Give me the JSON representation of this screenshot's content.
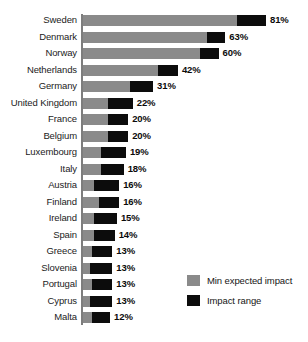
{
  "chart_data": {
    "type": "bar",
    "orientation": "horizontal",
    "stacked": true,
    "title": "",
    "subtitle": "",
    "xlabel": "",
    "ylabel": "",
    "grid": false,
    "xlim": [
      0,
      81
    ],
    "axis_ticks": [],
    "legend_position": "bottom-right",
    "legend": [
      {
        "name": "Min expected impact",
        "color": "#8a8a8a"
      },
      {
        "name": "Impact range",
        "color": "#0c0c0c"
      }
    ],
    "categories": [
      "Sweden",
      "Denmark",
      "Norway",
      "Netherlands",
      "Germany",
      "United Kingdom",
      "France",
      "Belgium",
      "Luxembourg",
      "Italy",
      "Austria",
      "Finland",
      "Ireland",
      "Spain",
      "Greece",
      "Slovenia",
      "Portugal",
      "Cyprus",
      "Malta"
    ],
    "series": [
      {
        "name": "Min expected impact",
        "color": "#8a8a8a",
        "values": [
          68,
          55,
          52,
          33,
          21,
          11,
          11,
          11,
          8,
          8,
          5,
          7,
          5,
          5,
          4,
          3,
          4,
          3,
          4
        ]
      },
      {
        "name": "Impact range",
        "color": "#0c0c0c",
        "values": [
          13,
          8,
          8,
          9,
          10,
          11,
          9,
          9,
          11,
          10,
          11,
          9,
          10,
          9,
          9,
          10,
          9,
          10,
          8
        ]
      }
    ],
    "value_labels": [
      "81%",
      "63%",
      "60%",
      "42%",
      "31%",
      "22%",
      "20%",
      "20%",
      "19%",
      "18%",
      "16%",
      "16%",
      "15%",
      "14%",
      "13%",
      "13%",
      "13%",
      "13%",
      "12%"
    ],
    "totals": [
      81,
      63,
      60,
      42,
      31,
      22,
      20,
      20,
      19,
      18,
      16,
      16,
      15,
      14,
      13,
      13,
      13,
      13,
      12
    ],
    "rows": [
      {
        "category": "Sweden",
        "min": 68,
        "range": 13,
        "total": 81,
        "label": "81%"
      },
      {
        "category": "Denmark",
        "min": 55,
        "range": 8,
        "total": 63,
        "label": "63%"
      },
      {
        "category": "Norway",
        "min": 52,
        "range": 8,
        "total": 60,
        "label": "60%"
      },
      {
        "category": "Netherlands",
        "min": 33,
        "range": 9,
        "total": 42,
        "label": "42%"
      },
      {
        "category": "Germany",
        "min": 21,
        "range": 10,
        "total": 31,
        "label": "31%"
      },
      {
        "category": "United Kingdom",
        "min": 11,
        "range": 11,
        "total": 22,
        "label": "22%"
      },
      {
        "category": "France",
        "min": 11,
        "range": 9,
        "total": 20,
        "label": "20%"
      },
      {
        "category": "Belgium",
        "min": 11,
        "range": 9,
        "total": 20,
        "label": "20%"
      },
      {
        "category": "Luxembourg",
        "min": 8,
        "range": 11,
        "total": 19,
        "label": "19%"
      },
      {
        "category": "Italy",
        "min": 8,
        "range": 10,
        "total": 18,
        "label": "18%"
      },
      {
        "category": "Austria",
        "min": 5,
        "range": 11,
        "total": 16,
        "label": "16%"
      },
      {
        "category": "Finland",
        "min": 7,
        "range": 9,
        "total": 16,
        "label": "16%"
      },
      {
        "category": "Ireland",
        "min": 5,
        "range": 10,
        "total": 15,
        "label": "15%"
      },
      {
        "category": "Spain",
        "min": 5,
        "range": 9,
        "total": 14,
        "label": "14%"
      },
      {
        "category": "Greece",
        "min": 4,
        "range": 9,
        "total": 13,
        "label": "13%"
      },
      {
        "category": "Slovenia",
        "min": 3,
        "range": 10,
        "total": 13,
        "label": "13%"
      },
      {
        "category": "Portugal",
        "min": 4,
        "range": 9,
        "total": 13,
        "label": "13%"
      },
      {
        "category": "Cyprus",
        "min": 3,
        "range": 10,
        "total": 13,
        "label": "13%"
      },
      {
        "category": "Malta",
        "min": 4,
        "range": 8,
        "total": 12,
        "label": "12%"
      }
    ]
  },
  "colors": {
    "min_expected_impact": "#8a8a8a",
    "impact_range": "#0c0c0c",
    "axis": "#7d7d7d",
    "background": "#ffffff",
    "text": "#1b1b1b"
  }
}
